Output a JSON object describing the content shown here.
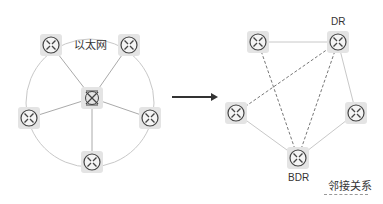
{
  "left_diagram": {
    "label": "以太网",
    "hub": {
      "name": "ethernet-hub",
      "x": 92,
      "y": 98
    },
    "routers": [
      {
        "name": "router-top-left",
        "x": 51,
        "y": 45
      },
      {
        "name": "router-top-right",
        "x": 129,
        "y": 45
      },
      {
        "name": "router-left",
        "x": 29,
        "y": 118
      },
      {
        "name": "router-right",
        "x": 150,
        "y": 118
      },
      {
        "name": "router-bottom",
        "x": 92,
        "y": 162
      }
    ],
    "ring": {
      "cx": 90,
      "cy": 103,
      "r": 64
    }
  },
  "arrow": {
    "x1": 172,
    "y1": 97,
    "x2": 218,
    "y2": 97
  },
  "right_diagram": {
    "routers": [
      {
        "name": "router-top-left",
        "x": 258,
        "y": 42,
        "label": ""
      },
      {
        "name": "router-dr",
        "x": 338,
        "y": 42,
        "label": "DR"
      },
      {
        "name": "router-left",
        "x": 236,
        "y": 113,
        "label": ""
      },
      {
        "name": "router-right",
        "x": 356,
        "y": 113,
        "label": ""
      },
      {
        "name": "router-bdr",
        "x": 298,
        "y": 158,
        "label": "BDR"
      }
    ],
    "solid_links": [
      [
        0,
        1
      ],
      [
        1,
        3
      ],
      [
        2,
        4
      ],
      [
        3,
        4
      ]
    ],
    "dashed_links": [
      [
        0,
        4
      ],
      [
        1,
        2
      ],
      [
        1,
        4
      ]
    ],
    "legend": {
      "label": "邻接关系",
      "style": "dashed"
    }
  },
  "colors": {
    "line": "#c8c8c8",
    "dashed": "#777777",
    "arrow": "#333333",
    "node_bg": "#e4e4e4",
    "icon": "#444444"
  }
}
